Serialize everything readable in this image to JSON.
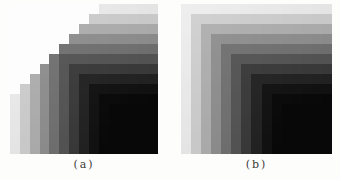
{
  "figure": {
    "background_color": "#fdfdfc",
    "caption_color": "#3a3a38",
    "panels": [
      {
        "id": "a",
        "caption_label": "(a)"
      },
      {
        "id": "b",
        "caption_label": "(b)"
      }
    ]
  },
  "chart_data": [
    {
      "type": "heatmap",
      "title": "(a)",
      "rows": 15,
      "cols": 15,
      "layout": "staircase: cells with row+col < threshold are blank white; visible region darkens toward bottom-right",
      "white_rule_threshold": 9,
      "gray_levels_by_min_index": [
        238,
        210,
        180,
        150,
        122,
        95,
        70,
        48,
        32,
        24,
        19,
        15,
        12,
        11,
        10
      ],
      "diagonal_shade_slope": 0.7,
      "min_gray": 8,
      "white_gray": 253,
      "legend": "gray level of cell = levels[min(row,col)] - slope*(row+col); horizontal bands in upper-right arm, vertical bands in lower-left arm, near-black lower-right quadrant"
    },
    {
      "type": "heatmap",
      "title": "(b)",
      "rows": 15,
      "cols": 15,
      "layout": "full square grid darkening from near-white top-left corner to crushed black bottom-right quadrant with L-shaped level bands",
      "white_rule_threshold": null,
      "gray_levels_by_min_index": [
        238,
        210,
        180,
        150,
        122,
        95,
        70,
        48,
        32,
        24,
        19,
        15,
        12,
        11,
        10
      ],
      "diagonal_shade_slope": 0.7,
      "min_gray": 8,
      "white_gray": 253,
      "legend": "gray level of cell = levels[min(row,col)] - slope*(row+col); horizontal bands along top rows, vertical bands along left columns, near-black lower-right quadrant"
    }
  ]
}
